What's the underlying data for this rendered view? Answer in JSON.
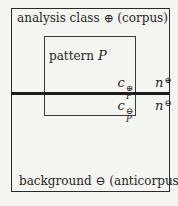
{
  "figure": {
    "regions": {
      "analysis_class_label": "analysis class ⊕ (corpus)",
      "background_label": "background ⊖ (anticorpus)"
    },
    "pattern": {
      "word": "pattern",
      "var": "P"
    },
    "counts": {
      "c_corpus": {
        "base": "c",
        "sub": "P",
        "sup": "⊕"
      },
      "c_anticorpus": {
        "base": "c",
        "sub": "P",
        "sup": "⊖"
      },
      "n_corpus": {
        "base": "n",
        "sup": "⊕"
      },
      "n_anticorpus": {
        "base": "n",
        "sup": "⊖"
      }
    },
    "colors": {
      "background": "#f4f4f1",
      "line": "#2b2b2b",
      "divider": "#1c1c1c",
      "text": "#262626"
    }
  }
}
